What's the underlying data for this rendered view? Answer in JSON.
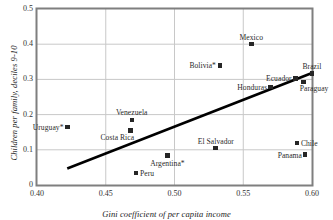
{
  "chart_data": {
    "type": "scatter",
    "title": "",
    "xlabel": "Gini coefficient of per capita income",
    "ylabel": "Children per family, deciles 9-10",
    "xlim": [
      0.4,
      0.6
    ],
    "ylim": [
      0,
      0.5
    ],
    "xticks": [
      "0.40",
      "0.45",
      "0.50",
      "0.55",
      "0.60"
    ],
    "yticks": [
      "0.5",
      "0.4",
      "0.3",
      "0.2",
      "0.1",
      "0"
    ],
    "xtick_values": [
      0.4,
      0.45,
      0.5,
      0.55,
      0.6
    ],
    "ytick_values": [
      0.5,
      0.4,
      0.3,
      0.2,
      0.1,
      0.0
    ],
    "grid": true,
    "legend": "none",
    "marker_color": "#262626",
    "grid_color": "#c8c8c8",
    "frame_color": "#7f7f7f",
    "trendline_color": "#000000",
    "points": [
      {
        "name": "Uruguay*",
        "x": 0.422,
        "y": 0.165,
        "label_pos": "left"
      },
      {
        "name": "Costa Rica",
        "x": 0.468,
        "y": 0.155,
        "label_pos": "below-left"
      },
      {
        "name": "Venezuela",
        "x": 0.469,
        "y": 0.185,
        "label_pos": "above"
      },
      {
        "name": "Peru",
        "x": 0.472,
        "y": 0.034,
        "label_pos": "right"
      },
      {
        "name": "Argentina*",
        "x": 0.495,
        "y": 0.083,
        "label_pos": "below"
      },
      {
        "name": "El Salvador",
        "x": 0.53,
        "y": 0.105,
        "label_pos": "above"
      },
      {
        "name": "Bolivia*",
        "x": 0.533,
        "y": 0.34,
        "label_pos": "left"
      },
      {
        "name": "Mexico",
        "x": 0.556,
        "y": 0.4,
        "label_pos": "above"
      },
      {
        "name": "Honduras",
        "x": 0.57,
        "y": 0.278,
        "label_pos": "left"
      },
      {
        "name": "Ecuador",
        "x": 0.588,
        "y": 0.303,
        "label_pos": "left"
      },
      {
        "name": "Chile",
        "x": 0.589,
        "y": 0.119,
        "label_pos": "right"
      },
      {
        "name": "Paraguay",
        "x": 0.594,
        "y": 0.293,
        "label_pos": "below-right"
      },
      {
        "name": "Panama",
        "x": 0.595,
        "y": 0.086,
        "label_pos": "left"
      },
      {
        "name": "Brazil",
        "x": 0.6,
        "y": 0.317,
        "label_pos": "above"
      }
    ],
    "trendline": {
      "x0": 0.422,
      "y0": 0.047,
      "x1": 0.6,
      "y1": 0.318
    }
  }
}
